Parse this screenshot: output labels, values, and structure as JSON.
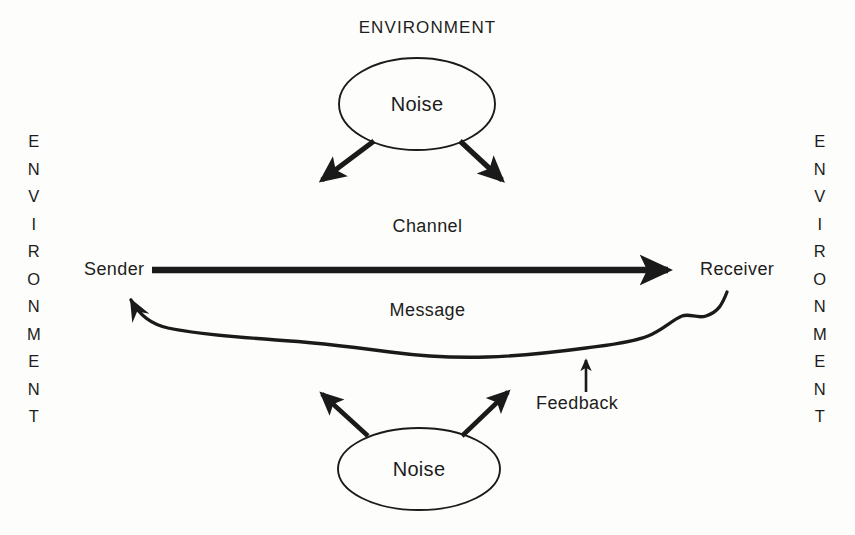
{
  "diagram": {
    "title_top": "ENVIRONMENT",
    "environment_left": "ENVIRONMENT",
    "environment_right": "ENVIRONMENT",
    "nodes": {
      "noise_top": "Noise",
      "noise_bottom": "Noise",
      "sender": "Sender",
      "receiver": "Receiver"
    },
    "labels": {
      "channel": "Channel",
      "message": "Message",
      "feedback": "Feedback"
    },
    "colors": {
      "ink": "#1d1d1d",
      "background": "#fdfdfb",
      "stroke": "#1a1a1a"
    }
  }
}
